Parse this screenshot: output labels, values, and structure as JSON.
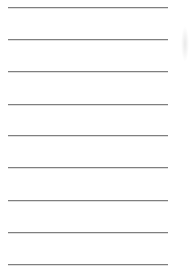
{
  "document": {
    "type": "lined-paper",
    "line_color": "#7f7f7f",
    "background": "#ffffff",
    "lines": [
      {
        "index": 1,
        "y": 7
      },
      {
        "index": 2,
        "y": 39
      },
      {
        "index": 3,
        "y": 71
      },
      {
        "index": 4,
        "y": 104
      },
      {
        "index": 5,
        "y": 135
      },
      {
        "index": 6,
        "y": 167
      },
      {
        "index": 7,
        "y": 200
      },
      {
        "index": 8,
        "y": 232
      },
      {
        "index": 9,
        "y": 264
      }
    ]
  }
}
